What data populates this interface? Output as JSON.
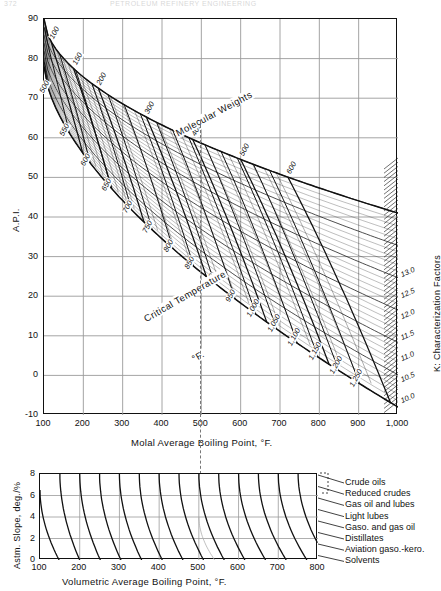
{
  "page": {
    "number": "372",
    "running_head": "PETROLEUM REFINERY ENGINEERING"
  },
  "chart_data": [
    {
      "id": "main-nomograph",
      "type": "line",
      "title": "",
      "xlabel": "Molal Average Boiling Point, °F.",
      "ylabel": "A.P.I.",
      "y2label": "K: Characterization Factors",
      "xlim": [
        100,
        1000
      ],
      "ylim": [
        -10,
        90
      ],
      "grid": true,
      "xticks": [
        100,
        200,
        300,
        400,
        500,
        600,
        700,
        800,
        900,
        1000
      ],
      "xticklabels": [
        "100",
        "200",
        "300",
        "400",
        "500",
        "600",
        "700",
        "800",
        "900",
        "1,000"
      ],
      "yticks": [
        -10,
        0,
        10,
        20,
        30,
        40,
        50,
        60,
        70,
        80,
        90
      ],
      "yticklabels": [
        "-10",
        "0",
        "10",
        "20",
        "30",
        "40",
        "50",
        "60",
        "70",
        "80",
        "90"
      ],
      "series": [
        {
          "name": "Molecular Weights",
          "label_text": "Molecular  Weights",
          "labels": [
            "100",
            "150",
            "200",
            "300",
            "400",
            "500",
            "600"
          ],
          "values": [
            100,
            150,
            200,
            300,
            400,
            500,
            600
          ]
        },
        {
          "name": "Critical Temperature",
          "label_text": "Critical  Temperature",
          "label_units": "°F.",
          "labels": [
            "500",
            "550",
            "600",
            "650",
            "700",
            "750",
            "800",
            "850",
            "900",
            "950",
            "1,000",
            "1,050",
            "1,100",
            "1,150",
            "1,200",
            "1,250"
          ],
          "values": [
            500,
            550,
            600,
            650,
            700,
            750,
            800,
            850,
            900,
            950,
            1000,
            1050,
            1100,
            1150,
            1200,
            1250
          ]
        },
        {
          "name": "K Characterization Factors",
          "labels": [
            "13.0",
            "12.5",
            "12.0",
            "11.5",
            "11.0",
            "10.5",
            "10.0"
          ],
          "values": [
            13.0,
            12.5,
            12.0,
            11.5,
            11.0,
            10.5,
            10.0
          ]
        }
      ],
      "annotations": [
        {
          "text": "Molecular  Weights",
          "x": 430,
          "y": 62
        },
        {
          "text": "Critical  Temperature",
          "x": 350,
          "y": 15
        },
        {
          "text": "°F.",
          "x": 470,
          "y": 5
        }
      ],
      "reference_line": {
        "x": 500,
        "style": "dashed"
      }
    },
    {
      "id": "astm-slope-chart",
      "type": "line",
      "title": "",
      "xlabel": "Volumetric Average Boiling Point, °F.",
      "ylabel": "Astm. Slope, deg./%",
      "xlim": [
        100,
        800
      ],
      "ylim": [
        0,
        8
      ],
      "grid": true,
      "xticks": [
        100,
        200,
        300,
        400,
        500,
        600,
        700,
        800
      ],
      "xticklabels": [
        "100",
        "200",
        "300",
        "400",
        "500",
        "600",
        "700",
        "800"
      ],
      "yticks": [
        0,
        2,
        4,
        6,
        8
      ],
      "yticklabels": [
        "0",
        "2",
        "4",
        "6",
        "8"
      ],
      "legend_position": "right",
      "legend": [
        "Crude oils",
        "Reduced crudes",
        "Gas oil and lubes",
        "Light lubes",
        "Gaso. and gas oil",
        "Distillates",
        "Aviation gaso.-kero.",
        "Solvents"
      ],
      "reference_line": {
        "x": 500,
        "style": "dashed"
      }
    }
  ],
  "colors": {
    "ink": "#111111",
    "grid": "#9a9a9a",
    "paper": "#ffffff",
    "dash": "#777777"
  }
}
